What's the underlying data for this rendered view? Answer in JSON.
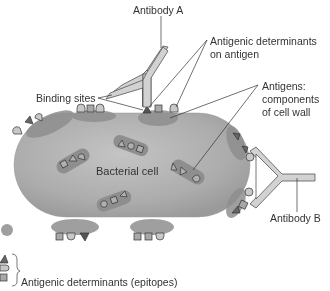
{
  "diagram": {
    "labels": {
      "antibody_a": "Antibody A",
      "antibody_b": "Antibody B",
      "antigenic_determinants_line1": "Antigenic determinants",
      "antigenic_determinants_line2": "on antigen",
      "binding_sites": "Binding sites",
      "antigens_line1": "Antigens:",
      "antigens_line2": "components",
      "antigens_line3": "of cell wall",
      "bacterial_cell": "Bacterial cell",
      "legend": "Antigenic determinants (epitopes)"
    },
    "legend_shapes": [
      "triangle",
      "half-circle",
      "square"
    ],
    "colors": {
      "cell_fill": "#a9a9a9",
      "cell_light": "#c2c2c2",
      "antigen_patch": "#8c8c8c",
      "antibody_fill": "#d0d0d0",
      "epitope_dark": "#666666",
      "epitope_light": "#c8c8c8",
      "line": "#333333",
      "text": "#333333"
    }
  }
}
